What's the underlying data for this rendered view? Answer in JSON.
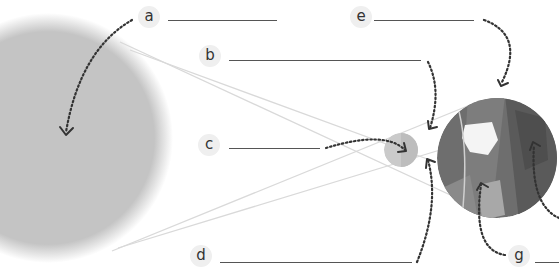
{
  "diagram": {
    "colors": {
      "sun": "#c4c4c4",
      "moon": "#c8c8c8",
      "earth_ocean": "#7a7a7a",
      "earth_land": "#5c5c5c",
      "earth_light": "#b4b4b4",
      "ray": "#d6d6d6",
      "pointer": "#333333"
    },
    "bodies": [
      {
        "id": "sun",
        "name": "Sun"
      },
      {
        "id": "moon",
        "name": "Moon"
      },
      {
        "id": "earth",
        "name": "Earth"
      }
    ],
    "labels": [
      {
        "letter": "a",
        "answer": "",
        "points_to": "sun"
      },
      {
        "letter": "b",
        "answer": "",
        "points_to": "penumbra ray region near moon"
      },
      {
        "letter": "c",
        "answer": "",
        "points_to": "moon"
      },
      {
        "letter": "d",
        "answer": "",
        "points_to": "ray region below moon"
      },
      {
        "letter": "e",
        "answer": "",
        "points_to": "earth"
      },
      {
        "letter": "f",
        "answer": "",
        "points_to": "earth surface (right)"
      },
      {
        "letter": "g",
        "answer": "",
        "points_to": "earth surface (shadow)"
      }
    ]
  }
}
